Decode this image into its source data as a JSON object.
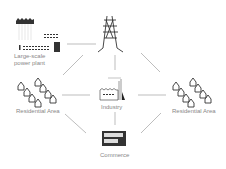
{
  "diagram": {
    "nodes": {
      "power_plant": {
        "label_line1": "Large-scale",
        "label_line2": "power plant",
        "icon": "power-plant-icon"
      },
      "tower": {
        "label": "",
        "icon": "transmission-tower-icon"
      },
      "industry": {
        "label": "Industry",
        "icon": "factory-icon"
      },
      "residential_left": {
        "label": "Residential Area",
        "icon": "houses-icon"
      },
      "residential_right": {
        "label": "Residential Area",
        "icon": "houses-icon"
      },
      "commerce": {
        "label": "Commerce",
        "icon": "commercial-building-icon"
      }
    },
    "edges": [
      [
        "power_plant",
        "tower"
      ],
      [
        "tower",
        "residential_left"
      ],
      [
        "tower",
        "industry"
      ],
      [
        "tower",
        "residential_right"
      ],
      [
        "residential_left",
        "industry"
      ],
      [
        "industry",
        "residential_right"
      ],
      [
        "residential_left",
        "commerce"
      ],
      [
        "industry",
        "commerce"
      ],
      [
        "residential_right",
        "commerce"
      ]
    ],
    "colors": {
      "icon": "#333333",
      "line": "#999999",
      "label": "#888888"
    }
  }
}
